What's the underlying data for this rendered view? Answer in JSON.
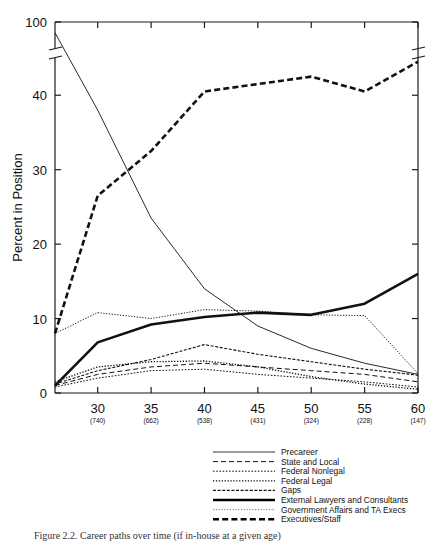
{
  "figure": {
    "caption": "Figure 2.2.  Career paths over time (if in-house at a given age)"
  },
  "chart_data": {
    "type": "line",
    "title": "",
    "xlabel": "",
    "ylabel": "Percent in Position",
    "xlim": [
      26,
      60
    ],
    "ylim": [
      0,
      100
    ],
    "y_axis_break": {
      "present": true,
      "between": [
        45,
        95
      ]
    },
    "yticks": [
      0,
      10,
      20,
      30,
      40,
      100
    ],
    "yticklabels": [
      "0",
      "10",
      "20",
      "30",
      "40",
      "100"
    ],
    "xticks": [
      30,
      35,
      40,
      45,
      50,
      55,
      60
    ],
    "xticklabels": [
      "30",
      "35",
      "40",
      "45",
      "50",
      "55",
      "60"
    ],
    "xtick_sublabels": [
      "(740)",
      "(662)",
      "(538)",
      "(431)",
      "(324)",
      "(228)",
      "(147)"
    ],
    "grid": false,
    "legend_position": "bottom-center",
    "x": [
      26,
      30,
      35,
      40,
      45,
      50,
      55,
      60
    ],
    "series": [
      {
        "name": "Precareer",
        "style": "solid-thin",
        "values": [
          98.0,
          38.0,
          23.5,
          14.0,
          9.0,
          6.0,
          4.0,
          2.5
        ]
      },
      {
        "name": "State and Local",
        "style": "dashed",
        "values": [
          1.0,
          2.5,
          3.5,
          4.0,
          3.5,
          3.0,
          2.5,
          1.5
        ]
      },
      {
        "name": "Federal Nonlegal",
        "style": "fine-dotted",
        "values": [
          0.8,
          2.0,
          3.0,
          3.2,
          2.5,
          2.0,
          1.5,
          0.8
        ]
      },
      {
        "name": "Federal Legal",
        "style": "dotted",
        "values": [
          1.5,
          3.5,
          4.2,
          4.3,
          3.5,
          2.2,
          1.2,
          0.5
        ]
      },
      {
        "name": "Gaps",
        "style": "dash-dot",
        "values": [
          1.2,
          3.0,
          4.5,
          6.5,
          5.2,
          4.2,
          3.2,
          2.4
        ]
      },
      {
        "name": "External Lawyers and Consultants",
        "style": "solid-thick",
        "values": [
          1.0,
          6.8,
          9.2,
          10.2,
          10.8,
          10.5,
          12.0,
          16.0
        ]
      },
      {
        "name": "Government Affairs and TA Execs",
        "style": "light-dotted",
        "values": [
          8.0,
          10.8,
          10.0,
          11.2,
          11.0,
          10.5,
          10.4,
          2.6
        ]
      },
      {
        "name": "Executives/Staff",
        "style": "heavy-dashed",
        "values": [
          8.0,
          26.5,
          32.5,
          40.5,
          41.5,
          42.5,
          40.5,
          44.5
        ]
      }
    ]
  },
  "legend": {
    "entries": [
      {
        "label": "Precareer",
        "style": "solid-thin"
      },
      {
        "label": "State and Local",
        "style": "dashed"
      },
      {
        "label": "Federal Nonlegal",
        "style": "fine-dotted"
      },
      {
        "label": "Federal Legal",
        "style": "dotted"
      },
      {
        "label": "Gaps",
        "style": "dash-dot"
      },
      {
        "label": "External Lawyers and Consultants",
        "style": "solid-thick"
      },
      {
        "label": "Government Affairs and TA Execs",
        "style": "light-dotted"
      },
      {
        "label": "Executives/Staff",
        "style": "heavy-dashed"
      }
    ]
  },
  "colors": {
    "ink": "#111111",
    "paper": "#ffffff",
    "light_ink": "#777777"
  }
}
